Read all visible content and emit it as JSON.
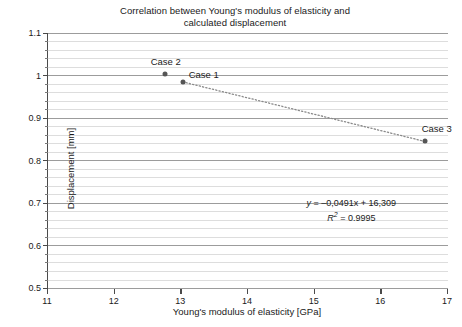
{
  "chart_data": {
    "type": "scatter",
    "title": "Correlation between Young's modulus of elasticity and calculated displacement",
    "title_line1": "Correlation between Young's modulus of elasticity and",
    "title_line2": "calculated displacement",
    "xlabel": "Young's modulus of elasticity [GPa]",
    "ylabel": "Displacement [mm]",
    "xlim": [
      11,
      17
    ],
    "ylim": [
      0.5,
      1.1
    ],
    "xticks": [
      "11",
      "12",
      "13",
      "14",
      "15",
      "16",
      "17"
    ],
    "xtick_values": [
      11,
      12,
      13,
      14,
      15,
      16,
      17
    ],
    "yticks": [
      "0.5",
      "0.6",
      "0.7",
      "0.8",
      "0.9",
      "1",
      "1.1"
    ],
    "ytick_values": [
      0.5,
      0.6,
      0.7,
      0.8,
      0.9,
      1.0,
      1.1
    ],
    "grid": "horizontal-minor-0.02-major-0.1",
    "minor_y_step": 0.02,
    "legend": "none",
    "series": [
      {
        "name": "calculated displacement",
        "marker": "circle",
        "marker_color": "#555555",
        "points": [
          {
            "label": "Case 2",
            "x": 12.75,
            "y": 1.003,
            "label_dx": -14,
            "label_dy": -13
          },
          {
            "label": "Case 1",
            "x": 13.02,
            "y": 0.985,
            "label_dx": 6,
            "label_dy": -8
          },
          {
            "label": "Case 3",
            "x": 16.65,
            "y": 0.845,
            "label_dx": -3,
            "label_dy": -13
          }
        ]
      }
    ],
    "trendline": {
      "style": "dotted",
      "color": "#8a8a8a",
      "from_x": 13.02,
      "from_y": 0.985,
      "to_x": 16.65,
      "to_y": 0.845,
      "equation": "y = –0,0491x + 16,309",
      "equation_prefix": "y",
      "equation_body": " = –0,0491x + 16,309",
      "r_squared_prefix": "R",
      "r_squared_sup": "2",
      "r_squared_body": " = 0.9995",
      "r_squared_value": 0.9995
    },
    "annotation_position": {
      "x": 15.55,
      "y": 0.715
    },
    "colors": {
      "grid_minor": "#dddddd",
      "grid_major": "#9c9c9c",
      "axis": "#4a4a4a",
      "text": "#1a1a1a",
      "marker": "#555555",
      "trend": "#8a8a8a",
      "background": "#ffffff"
    }
  }
}
